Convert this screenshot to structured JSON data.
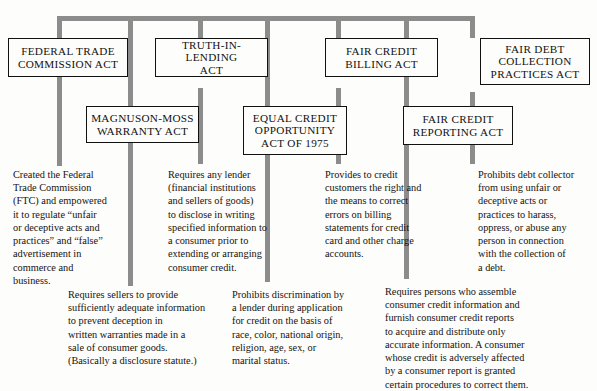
{
  "diagram": {
    "title_fragment": "",
    "line_color": "#8c8c8c",
    "box_border_color": "#111111",
    "text_color": "#16120f",
    "boxes": [
      {
        "id": "ftc-act",
        "label": "FEDERAL TRADE\nCOMMISSION ACT"
      },
      {
        "id": "til-act",
        "label": "TRUTH-IN-LENDING\nACT"
      },
      {
        "id": "fcb-act",
        "label": "FAIR CREDIT\nBILLING ACT"
      },
      {
        "id": "fdcp-act",
        "label": "FAIR DEBT\nCOLLECTION\nPRACTICES ACT"
      },
      {
        "id": "mm-warranty",
        "label": "MAGNUSON-MOSS\nWARRANTY ACT"
      },
      {
        "id": "eco-act",
        "label": "EQUAL CREDIT\nOPPORTUNITY\nACT OF 1975"
      },
      {
        "id": "fcr-act",
        "label": "FAIR CREDIT\nREPORTING ACT"
      }
    ],
    "descriptions": [
      {
        "id": "ftc-desc",
        "for": "FEDERAL TRADE COMMISSION ACT",
        "text": "Created the Federal\nTrade Commission\n(FTC) and empowered\nit to regulate “unfair\nor deceptive acts and\npractices” and “false”\nadvertisement in\ncommerce and\nbusiness."
      },
      {
        "id": "til-desc",
        "for": "TRUTH-IN-LENDING ACT",
        "text": "Requires any lender\n(financial institutions\nand sellers of goods)\nto disclose in writing\nspecified information to\na consumer prior to\nextending or arranging\nconsumer credit."
      },
      {
        "id": "fcb-desc",
        "for": "FAIR CREDIT BILLING ACT",
        "text": "Provides to credit\ncustomers the right and\nthe means to correct\nerrors on billing\nstatements for credit\ncard and other charge\naccounts."
      },
      {
        "id": "fdcp-desc",
        "for": "FAIR DEBT COLLECTION PRACTICES ACT",
        "text": "Prohibits debt collector\nfrom using unfair or\ndeceptive acts or\npractices to harass,\noppress, or abuse any\nperson in connection\nwith the collection of\na debt."
      },
      {
        "id": "mm-desc",
        "for": "MAGNUSON-MOSS WARRANTY ACT",
        "text": "Requires sellers to provide\nsufficiently adequate information\nto prevent deception in\nwritten warranties made in a\nsale of consumer goods.\n(Basically a disclosure statute.)"
      },
      {
        "id": "eco-desc",
        "for": "EQUAL CREDIT OPPORTUNITY ACT OF 1975",
        "text": "Prohibits discrimination by\na lender during application\nfor credit on the basis of\nrace, color, national origin,\nreligion, age, sex, or\nmarital status."
      },
      {
        "id": "fcr-desc",
        "for": "FAIR CREDIT REPORTING ACT",
        "text": "Requires persons who assemble\nconsumer credit information and\nfurnish consumer credit reports\nto acquire and distribute only\naccurate information.  A consumer\nwhose credit is adversely affected\nby a consumer report is granted\ncertain procedures to correct them."
      }
    ]
  }
}
